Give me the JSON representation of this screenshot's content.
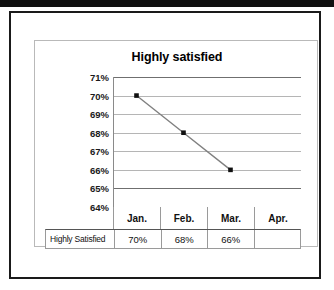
{
  "chart_data": {
    "type": "line",
    "title": "Highly satisfied",
    "xlabel": "",
    "ylabel": "",
    "categories": [
      "Jan.",
      "Feb.",
      "Mar.",
      "Apr."
    ],
    "series": [
      {
        "name": "Highly Satisfied",
        "values": [
          70,
          68,
          66,
          null
        ],
        "value_labels": [
          "70%",
          "68%",
          "66%",
          ""
        ]
      }
    ],
    "ytick_labels": [
      "71%",
      "70%",
      "69%",
      "68%",
      "67%",
      "66%",
      "65%",
      "64%"
    ],
    "ytick_values": [
      71,
      70,
      69,
      68,
      67,
      66,
      65,
      64
    ],
    "ylim": [
      64,
      71
    ],
    "grid": true,
    "legend": "none",
    "data_table": {
      "visible": true,
      "row_label": "Highly Satisfied",
      "columns": [
        "Jan.",
        "Feb.",
        "Mar.",
        "Apr."
      ],
      "cells": [
        "70%",
        "68%",
        "66%",
        ""
      ]
    },
    "colors": {
      "line": "#808080",
      "marker": "#101010",
      "gridline": "#b5b5b5",
      "axis": "#6f6f6f",
      "text": "#111111",
      "background": "#ffffff",
      "frame": "#1a1a1a"
    }
  }
}
